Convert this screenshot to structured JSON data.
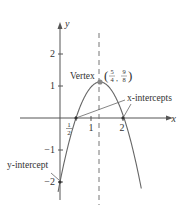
{
  "chart_data": {
    "type": "line",
    "title": "",
    "function": "y = -2x^2 + 5x - 2",
    "xlabel": "x",
    "ylabel": "y",
    "xlim": [
      -0.4,
      2.75
    ],
    "ylim": [
      -2.5,
      2.7
    ],
    "x_ticks": [
      {
        "value": 0.5,
        "label": "1/2"
      },
      {
        "value": 1,
        "label": "1"
      },
      {
        "value": 2,
        "label": "2"
      }
    ],
    "y_ticks": [
      {
        "value": 2,
        "label": "2"
      },
      {
        "value": 1,
        "label": "1"
      },
      {
        "value": -1,
        "label": "−1"
      },
      {
        "value": -2,
        "label": "−2"
      }
    ],
    "axis_of_symmetry": 1.25,
    "points": {
      "vertex": {
        "x": 1.25,
        "y": 1.125,
        "label": "Vertex",
        "coord_label": {
          "x_num": "5",
          "x_den": "4",
          "y_num": "9",
          "y_den": "8"
        }
      },
      "x_intercepts": [
        {
          "x": 0.5,
          "y": 0
        },
        {
          "x": 2,
          "y": 0
        }
      ],
      "y_intercept": {
        "x": 0,
        "y": -2
      }
    },
    "annotations": {
      "x_intercepts": "x-intercepts",
      "y_intercept": "y-intercept"
    },
    "grid": false,
    "curve_color": "#555555",
    "point_color": "#888888"
  }
}
